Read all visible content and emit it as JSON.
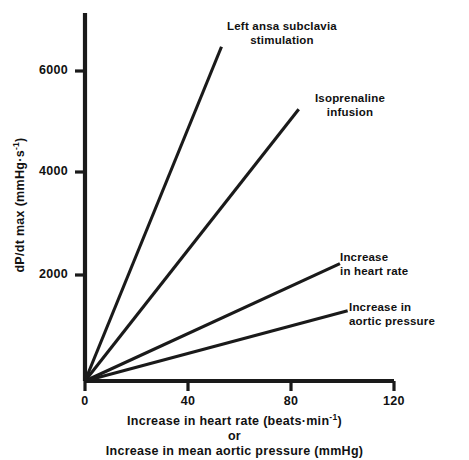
{
  "chart_data": {
    "type": "line",
    "title": "",
    "xlabel_lines": [
      "Increase in heart rate (beats·min",
      "or",
      "Increase in mean aortic pressure (mmHg)"
    ],
    "xlabel_line1_prefix": "Increase in heart rate (beats·min",
    "xlabel_line1_sup": "-1",
    "xlabel_line1_suffix": ")",
    "xlabel_or": "or",
    "xlabel_line3": "Increase in mean aortic pressure (mmHg)",
    "ylabel_prefix": "dP/dt max (mmHg·s",
    "ylabel_sup": "-1",
    "ylabel_suffix": ")",
    "xlim": [
      0,
      120
    ],
    "ylim": [
      0,
      6900
    ],
    "xticks": [
      0,
      40,
      80,
      120
    ],
    "xtick_labels": [
      "0",
      "40",
      "80",
      "120"
    ],
    "yticks": [
      2000,
      4000,
      6000
    ],
    "ytick_labels": [
      "2000",
      "4000",
      "6000"
    ],
    "grid": false,
    "legend_position": "inline-annotations",
    "line_color": "#1a1a1a",
    "axis_color": "#1a1a1a",
    "background_color": "#ffffff",
    "series": [
      {
        "name": "Left ansa subclavia stimulation",
        "label_lines": [
          "Left ansa subclavia",
          "stimulation"
        ],
        "x": [
          0,
          53
        ],
        "values": [
          0,
          6470
        ],
        "slope": 122.1
      },
      {
        "name": "Isoprenaline infusion",
        "label_lines": [
          "Isoprenaline",
          "infusion"
        ],
        "x": [
          0,
          83
        ],
        "values": [
          0,
          5260
        ],
        "slope": 63.4
      },
      {
        "name": "Increase in heart rate",
        "label_lines": [
          "Increase",
          "in heart rate"
        ],
        "x": [
          0,
          99
        ],
        "values": [
          0,
          2270
        ],
        "slope": 22.9
      },
      {
        "name": "Increase in aortic pressure",
        "label_lines": [
          "Increase in",
          "aortic pressure"
        ],
        "x": [
          0,
          102
        ],
        "values": [
          0,
          1360
        ],
        "slope": 13.3
      }
    ]
  },
  "annotations": {
    "ansa_line1": "Left ansa subclavia",
    "ansa_line2": "stimulation",
    "iso_line1": "Isoprenaline",
    "iso_line2": "infusion",
    "hr_line1": "Increase",
    "hr_line2": "in heart rate",
    "ap_line1": "Increase in",
    "ap_line2": "aortic pressure"
  },
  "axes": {
    "x0": "0",
    "x40": "40",
    "x80": "80",
    "x120": "120",
    "y2000": "2000",
    "y4000": "4000",
    "y6000": "6000"
  }
}
